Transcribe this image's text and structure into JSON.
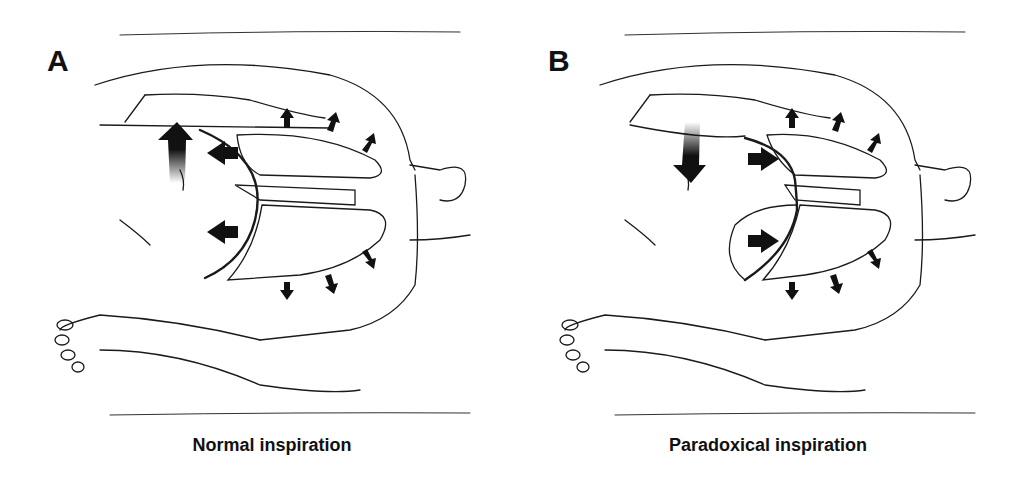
{
  "figure": {
    "panels": [
      {
        "letter": "A",
        "caption": "Normal inspiration",
        "abdomen_arrow_direction": "up",
        "diaphragm_arrow_direction": "left (caudal)",
        "chest_wall_arrows": "outward"
      },
      {
        "letter": "B",
        "caption": "Paradoxical inspiration",
        "abdomen_arrow_direction": "down",
        "diaphragm_arrow_direction": "right (cranial)",
        "chest_wall_arrows": "outward"
      }
    ],
    "colors": {
      "line": "#1a1a1a",
      "arrow": "#111111",
      "background": "#ffffff"
    }
  }
}
